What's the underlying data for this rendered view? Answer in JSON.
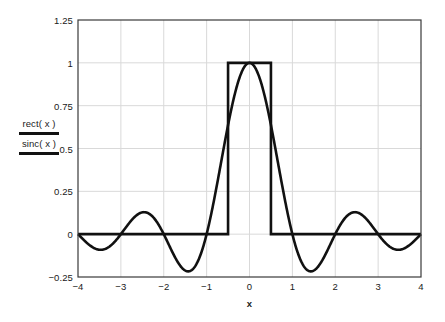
{
  "figure": {
    "background_color": "#ffffff",
    "frame_color": "#3a3a3a",
    "grid_color": "#d9d9d9",
    "curve_color": "#111111"
  },
  "legend": {
    "entries": [
      {
        "label": "rect( x )",
        "color": "#111111"
      },
      {
        "label": "sinc( x )",
        "color": "#111111"
      }
    ]
  },
  "axes": {
    "x_title": "x",
    "y_title": "",
    "x_tick_labels": [
      "−4",
      "−3",
      "−2",
      "−1",
      "0",
      "1",
      "2",
      "3",
      "4"
    ],
    "y_tick_labels": [
      "1.25",
      "1",
      "0.75",
      "0.5",
      "0.25",
      "0",
      "−0.25"
    ]
  },
  "chart_data": {
    "type": "line",
    "title": "",
    "xlabel": "x",
    "ylabel": "rect( x ) / sinc( x )",
    "xlim": [
      -4,
      4
    ],
    "ylim": [
      -0.25,
      1.25
    ],
    "xticks": [
      -4,
      -3,
      -2,
      -1,
      0,
      1,
      2,
      3,
      4
    ],
    "yticks": [
      -0.25,
      0,
      0.25,
      0.5,
      0.75,
      1,
      1.25
    ],
    "grid": true,
    "legend_position": "left-outside",
    "series": [
      {
        "name": "rect( x )",
        "color": "#111111",
        "formula": "rect(x) = 1 for |x| < 0.5, else 0",
        "x": [
          -4,
          -0.5,
          -0.5,
          0.5,
          0.5,
          4
        ],
        "values": [
          0,
          0,
          1,
          1,
          0,
          0
        ]
      },
      {
        "name": "sinc( x )",
        "color": "#111111",
        "formula": "sinc(x) = sin(pi*x)/(pi*x)",
        "zeros": [
          -4,
          -3,
          -2,
          -1,
          1,
          2,
          3,
          4
        ],
        "peak": {
          "x": 0,
          "y": 1
        },
        "extrema": [
          {
            "x": -3.47,
            "y": -0.0913
          },
          {
            "x": -2.46,
            "y": 0.1284
          },
          {
            "x": -1.43,
            "y": -0.2172
          },
          {
            "x": 0,
            "y": 1
          },
          {
            "x": 1.43,
            "y": -0.2172
          },
          {
            "x": 2.46,
            "y": 0.1284
          },
          {
            "x": 3.47,
            "y": -0.0913
          }
        ],
        "x": [
          -4,
          -3.8,
          -3.6,
          -3.47,
          -3.4,
          -3.2,
          -3,
          -2.8,
          -2.6,
          -2.46,
          -2.4,
          -2.2,
          -2,
          -1.8,
          -1.6,
          -1.43,
          -1.4,
          -1.2,
          -1,
          -0.8,
          -0.6,
          -0.5,
          -0.4,
          -0.2,
          0,
          0.2,
          0.4,
          0.5,
          0.6,
          0.8,
          1,
          1.2,
          1.4,
          1.43,
          1.6,
          1.8,
          2,
          2.2,
          2.4,
          2.46,
          2.6,
          2.8,
          3,
          3.2,
          3.4,
          3.47,
          3.6,
          3.8,
          4
        ],
        "values": [
          0,
          0.0497,
          0.0873,
          0.0913,
          0.0898,
          0.0584,
          0,
          -0.0668,
          -0.1166,
          -0.1284,
          -0.1261,
          -0.0851,
          0,
          0.1039,
          0.1892,
          0.2172,
          0.2162,
          0.1514,
          0,
          -0.1871,
          -0.3364,
          -0.6366,
          -0.7568,
          -0.9355,
          1,
          0.9355,
          0.7568,
          0.6366,
          0.5046,
          0.2339,
          0,
          -0.1514,
          -0.2162,
          -0.2172,
          -0.1892,
          -0.1039,
          0,
          0.0851,
          0.1261,
          0.1284,
          0.1166,
          0.0668,
          0,
          -0.0584,
          -0.0898,
          -0.0913,
          -0.0873,
          -0.0497,
          0
        ]
      }
    ]
  }
}
